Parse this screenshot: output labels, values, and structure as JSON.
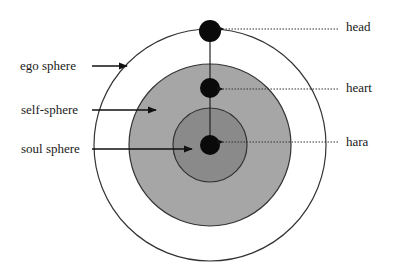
{
  "diagram": {
    "type": "concentric-spheres",
    "center": [
      210,
      145
    ],
    "spheres": [
      {
        "id": "ego",
        "label": "ego sphere",
        "radius": 116,
        "fill": "#ffffff",
        "stroke": "#333333"
      },
      {
        "id": "self",
        "label": "self-sphere",
        "radius": 81,
        "fill": "#a6a6a6",
        "stroke": "#333333"
      },
      {
        "id": "soul",
        "label": "soul sphere",
        "radius": 37,
        "fill": "#8a8a8a",
        "stroke": "#333333"
      }
    ],
    "centers": [
      {
        "id": "head",
        "label": "head",
        "cy": 31,
        "r": 11
      },
      {
        "id": "heart",
        "label": "heart",
        "cy": 88,
        "r": 10
      },
      {
        "id": "hara",
        "label": "hara",
        "cy": 145,
        "r": 10
      }
    ],
    "left_labels": [
      {
        "text": "ego sphere",
        "y": 66
      },
      {
        "text": "self-sphere",
        "y": 110
      },
      {
        "text": "soul sphere",
        "y": 149
      }
    ],
    "right_labels": [
      {
        "text": "head",
        "y": 28
      },
      {
        "text": "heart",
        "y": 88
      },
      {
        "text": "hara",
        "y": 145
      }
    ],
    "colors": {
      "dot": "#0a0a0a",
      "line": "#222222"
    }
  }
}
